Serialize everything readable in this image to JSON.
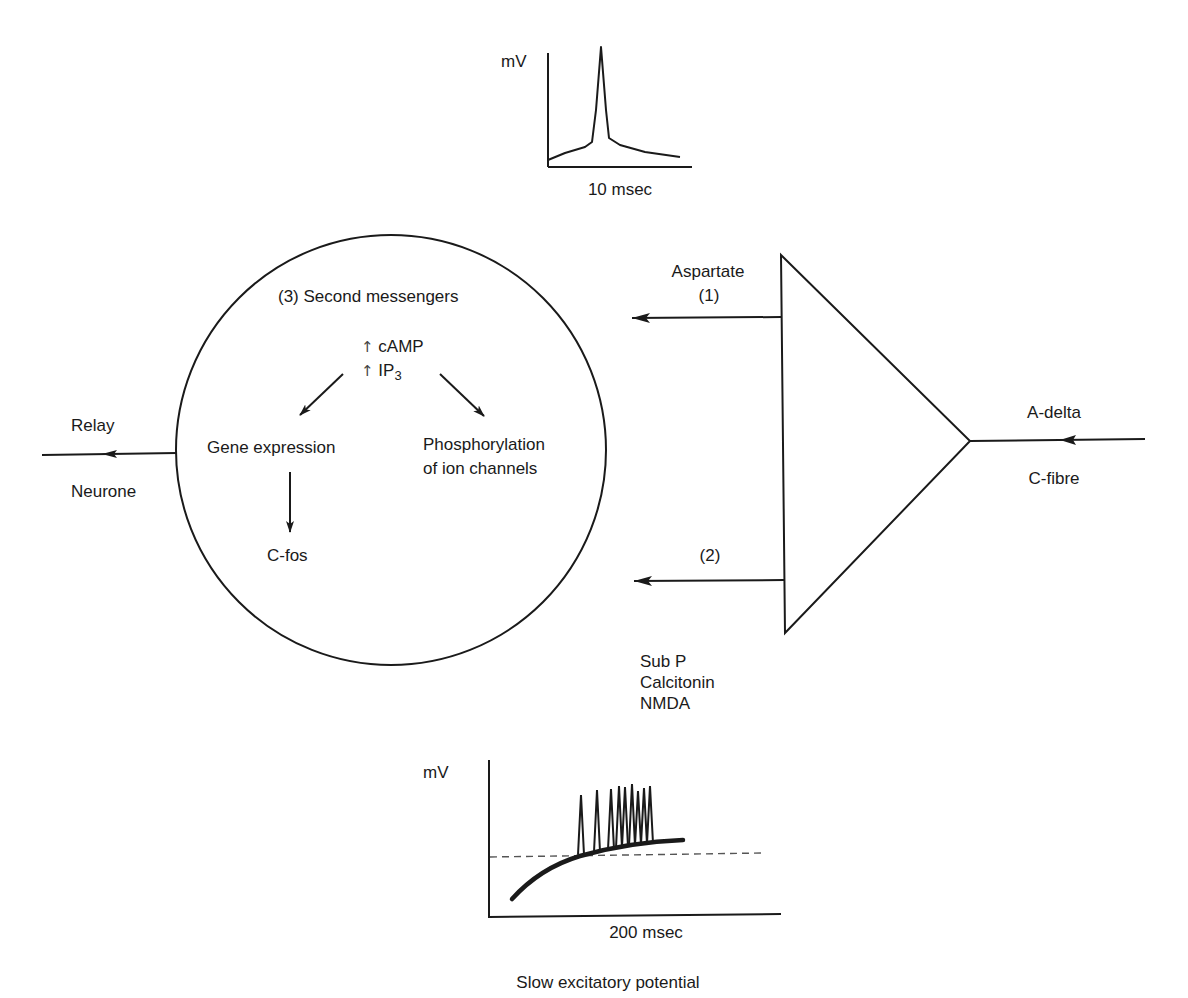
{
  "top_graph": {
    "y_label": "mV",
    "x_label": "10 msec",
    "trace": [
      [
        548,
        160
      ],
      [
        565,
        153
      ],
      [
        585,
        147
      ],
      [
        592,
        142
      ],
      [
        596,
        110
      ],
      [
        601,
        47
      ],
      [
        606,
        110
      ],
      [
        609,
        138
      ],
      [
        620,
        145
      ],
      [
        645,
        152
      ],
      [
        680,
        157
      ]
    ]
  },
  "cell": {
    "title": "(3) Second messengers",
    "messenger_1_arrow": "↑",
    "messenger_1": "cAMP",
    "messenger_2_arrow": "↑",
    "messenger_2": "IP",
    "messenger_2_sub": "3",
    "gene_expression": "Gene expression",
    "phosphorylation_line1": "Phosphorylation",
    "phosphorylation_line2": "of ion channels",
    "c_fos": "C-fos"
  },
  "relay": {
    "label_top": "Relay",
    "label_bottom": "Neurone"
  },
  "terminal": {
    "aspartate": "Aspartate",
    "pathway_1": "(1)",
    "pathway_2": "(2)",
    "neurotransmitters": [
      "Sub P",
      "Calcitonin",
      "NMDA"
    ]
  },
  "input": {
    "label_top": "A-delta",
    "label_bottom": "C-fibre"
  },
  "bottom_graph": {
    "y_label": "mV",
    "x_label": "200 msec",
    "caption": "Slow excitatory potential",
    "threshold_y": 856,
    "spike_x": [
      581,
      597,
      611,
      619,
      625,
      632,
      638,
      644,
      650
    ],
    "spike_tops": [
      795,
      790,
      789,
      786,
      787,
      784,
      791,
      788,
      786
    ]
  },
  "colors": {
    "ink": "#1a1a1a",
    "background": "#ffffff"
  }
}
